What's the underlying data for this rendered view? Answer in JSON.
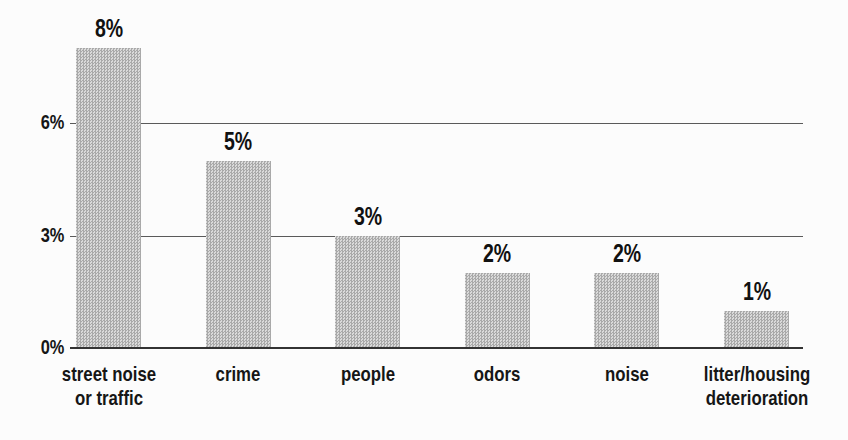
{
  "chart_data": {
    "type": "bar",
    "title": "",
    "xlabel": "",
    "ylabel": "",
    "categories": [
      "street noise or traffic",
      "crime",
      "people",
      "odors",
      "noise",
      "litter/housing deterioration"
    ],
    "values": [
      8,
      5,
      3,
      2,
      2,
      1
    ],
    "value_labels": [
      "8%",
      "5%",
      "3%",
      "2%",
      "2%",
      "1%"
    ],
    "yticks": [
      {
        "value": 0,
        "label": "0%"
      },
      {
        "value": 3,
        "label": "3%"
      },
      {
        "value": 6,
        "label": "6%"
      }
    ],
    "ylim": [
      0,
      8.5
    ],
    "grid": "horizontal-behind-bars",
    "legend": "none",
    "bar_color": "#c4c4c4",
    "bar_texture": "halftone-dots",
    "text_color": "#161616",
    "gridline_color": "#5a5a5a"
  }
}
